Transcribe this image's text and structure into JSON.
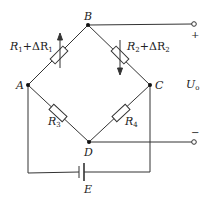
{
  "diagram": {
    "type": "wheatstone-bridge-circuit",
    "nodes": {
      "A": {
        "label": "A"
      },
      "B": {
        "label": "B"
      },
      "C": {
        "label": "C"
      },
      "D": {
        "label": "D"
      }
    },
    "resistors": {
      "r1": {
        "label": "R",
        "sub": "1",
        "extra": "+ΔR",
        "extra_sub": "1",
        "branch": "A-B",
        "arrow": "up"
      },
      "r2": {
        "label": "R",
        "sub": "2",
        "extra": "+ΔR",
        "extra_sub": "2",
        "branch": "B-C",
        "arrow": "down"
      },
      "r3": {
        "label": "R",
        "sub": "3",
        "branch": "A-D"
      },
      "r4": {
        "label": "R",
        "sub": "4",
        "branch": "C-D"
      }
    },
    "source": {
      "label": "E"
    },
    "output": {
      "label": "U",
      "sub": "o",
      "plus": "+",
      "minus": "−"
    }
  }
}
